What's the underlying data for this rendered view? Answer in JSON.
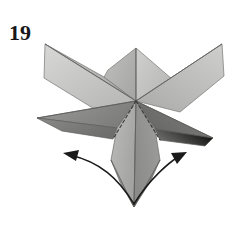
{
  "figure": {
    "step_number": "19",
    "background_color": "#ffffff",
    "ink_color": "#17171a"
  },
  "palette": {
    "paper_lightest": "#d2d2d0",
    "paper_light": "#c2c2c0",
    "paper_mid": "#b0b0ae",
    "paper_mid_dark": "#9a9a98",
    "paper_dark": "#868684",
    "paper_darker": "#757573",
    "paper_darkest": "#6a6a68",
    "edge_line": "#5b5b59",
    "fold_dash": "#3a3a38",
    "arrow": "#1a1a1a"
  },
  "facets": [
    {
      "name": "upper-left-spike",
      "fill": "paper_mid",
      "points": "45,44 136,101 104,77"
    },
    {
      "name": "upper-left-petal-front",
      "fill": "paper_light",
      "points": "45,44 136,101 96,110 44,78"
    },
    {
      "name": "top-center-left-panel",
      "fill": "paper_mid",
      "points": "136,48 136,101 104,77 108,70"
    },
    {
      "name": "top-center-right-panel",
      "fill": "paper_light",
      "points": "136,48 172,79 136,101"
    },
    {
      "name": "upper-right-spike",
      "fill": "paper_mid_dark",
      "points": "222,44 136,101 172,79"
    },
    {
      "name": "upper-right-petal-front",
      "fill": "paper_light",
      "points": "222,44 136,101 180,112 224,76"
    },
    {
      "name": "left-horizontal-point",
      "fill": "paper_dark",
      "points": "37,118 136,101 117,128"
    },
    {
      "name": "left-lower-petal",
      "fill": "paper_darker",
      "points": "37,118 117,128 113,139 62,131"
    },
    {
      "name": "right-lower-point",
      "fill": "paper_darkest",
      "points": "213,138 136,101 155,129"
    },
    {
      "name": "right-lower-petal",
      "fill": "paper_darker",
      "points": "213,138 155,129 160,140 205,146"
    },
    {
      "name": "center-body-left",
      "fill": "paper_mid",
      "points": "136,101 117,128 111,160 134,207"
    },
    {
      "name": "center-body-right",
      "fill": "paper_mid_dark",
      "points": "136,101 155,129 160,160 134,207"
    },
    {
      "name": "bottom-tail-left",
      "fill": "paper_dark",
      "points": "111,160 134,207 120,182"
    },
    {
      "name": "bottom-tail-right",
      "fill": "paper_darker",
      "points": "160,160 134,207 150,182"
    }
  ],
  "fold_lines": [
    {
      "name": "fold-left-valley",
      "from_x": 136,
      "from_y": 101,
      "to_x": 113,
      "to_y": 139
    },
    {
      "name": "fold-right-valley",
      "from_x": 136,
      "from_y": 101,
      "to_x": 160,
      "to_y": 140
    }
  ],
  "arrows": [
    {
      "name": "arrow-unfold-left",
      "direction": "left-outward",
      "path": "M 134,204 C 118,178 100,162 70,155",
      "head_x": 66,
      "head_y": 154,
      "head_angle": -192
    },
    {
      "name": "arrow-unfold-right",
      "direction": "right-outward",
      "path": "M 134,204 C 150,178 170,162 178,157",
      "head_x": 182,
      "head_y": 155,
      "head_angle": -22
    }
  ]
}
